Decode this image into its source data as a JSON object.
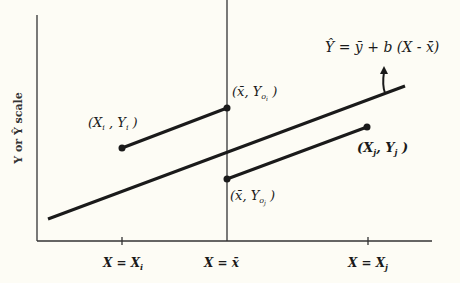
{
  "diagram": {
    "y_axis_label": "Y or Ŷ scale",
    "equation": "Ŷ = ȳ + b (X - x̄)",
    "x_ticks": [
      {
        "label_main": "X = X",
        "label_sub": "i"
      },
      {
        "label_main": "X = x̄",
        "label_sub": ""
      },
      {
        "label_main": "X = X",
        "label_sub": "j"
      }
    ],
    "points": {
      "pi": {
        "main": "(X",
        "sub1": "i",
        "mid": " , Y",
        "sub2": "i",
        "end": " )"
      },
      "poi": {
        "main": "(x̄, Y",
        "sub1": "o",
        "sub2": "i",
        "end": " )"
      },
      "pj": {
        "main": "(X",
        "sub1": "j",
        "mid": ", Y",
        "sub2": "j",
        "end": " )"
      },
      "poj": {
        "main": "(x̄, Y",
        "sub1": "o",
        "sub2": "j",
        "end": " )"
      }
    }
  }
}
